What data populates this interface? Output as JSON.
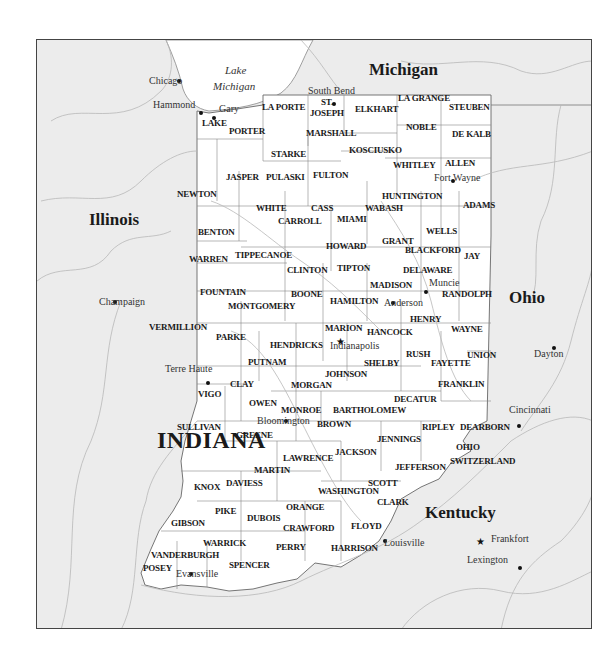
{
  "map": {
    "colors": {
      "background": "#ffffff",
      "neighbor_land": "#ececec",
      "indiana_fill": "#ffffff",
      "rivers": "#b8b8b8",
      "borders": "#777777",
      "frame": "#444444"
    },
    "lakes": [
      {
        "label_line1": "Lake",
        "label_line2": "Michigan",
        "x": 224,
        "y": 76
      }
    ],
    "states": [
      {
        "name": "Michigan",
        "x": 368,
        "y": 75,
        "main": false
      },
      {
        "name": "Illinois",
        "x": 88,
        "y": 225,
        "main": false
      },
      {
        "name": "Ohio",
        "x": 508,
        "y": 303,
        "main": false
      },
      {
        "name": "Kentucky",
        "x": 424,
        "y": 518,
        "main": false
      },
      {
        "name": "INDIANA",
        "x": 156,
        "y": 449,
        "main": true
      }
    ],
    "counties": [
      {
        "name": "LAKE",
        "x": 201,
        "y": 126
      },
      {
        "name": "PORTER",
        "x": 228,
        "y": 134
      },
      {
        "name": "LA PORTE",
        "x": 261,
        "y": 110
      },
      {
        "name": "ST.",
        "x": 320,
        "y": 105
      },
      {
        "name": "JOSEPH",
        "x": 309,
        "y": 116
      },
      {
        "name": "ELKHART",
        "x": 354,
        "y": 112
      },
      {
        "name": "LA GRANGE",
        "x": 397,
        "y": 101
      },
      {
        "name": "STEUBEN",
        "x": 448,
        "y": 110
      },
      {
        "name": "NOBLE",
        "x": 405,
        "y": 130
      },
      {
        "name": "DE KALB",
        "x": 451,
        "y": 137
      },
      {
        "name": "MARSHALL",
        "x": 305,
        "y": 136
      },
      {
        "name": "KOSCIUSKO",
        "x": 348,
        "y": 153
      },
      {
        "name": "STARKE",
        "x": 270,
        "y": 157
      },
      {
        "name": "WHITLEY",
        "x": 392,
        "y": 168
      },
      {
        "name": "ALLEN",
        "x": 444,
        "y": 166
      },
      {
        "name": "JASPER",
        "x": 225,
        "y": 180
      },
      {
        "name": "PULASKI",
        "x": 265,
        "y": 180
      },
      {
        "name": "FULTON",
        "x": 312,
        "y": 178
      },
      {
        "name": "NEWTON",
        "x": 176,
        "y": 197
      },
      {
        "name": "HUNTINGTON",
        "x": 381,
        "y": 199
      },
      {
        "name": "ADAMS",
        "x": 462,
        "y": 208
      },
      {
        "name": "WHITE",
        "x": 255,
        "y": 211
      },
      {
        "name": "CASS",
        "x": 310,
        "y": 211
      },
      {
        "name": "WABASH",
        "x": 364,
        "y": 211
      },
      {
        "name": "CARROLL",
        "x": 277,
        "y": 224
      },
      {
        "name": "MIAMI",
        "x": 336,
        "y": 222
      },
      {
        "name": "WELLS",
        "x": 425,
        "y": 234
      },
      {
        "name": "BENTON",
        "x": 197,
        "y": 235
      },
      {
        "name": "HOWARD",
        "x": 325,
        "y": 249
      },
      {
        "name": "GRANT",
        "x": 381,
        "y": 244
      },
      {
        "name": "BLACKFORD",
        "x": 404,
        "y": 253
      },
      {
        "name": "JAY",
        "x": 463,
        "y": 259
      },
      {
        "name": "WARREN",
        "x": 188,
        "y": 262
      },
      {
        "name": "TIPPECANOE",
        "x": 234,
        "y": 258
      },
      {
        "name": "CLINTON",
        "x": 286,
        "y": 273
      },
      {
        "name": "TIPTON",
        "x": 336,
        "y": 271
      },
      {
        "name": "DELAWARE",
        "x": 402,
        "y": 273
      },
      {
        "name": "MADISON",
        "x": 369,
        "y": 288
      },
      {
        "name": "RANDOLPH",
        "x": 441,
        "y": 297
      },
      {
        "name": "FOUNTAIN",
        "x": 199,
        "y": 295
      },
      {
        "name": "BOONE",
        "x": 290,
        "y": 297
      },
      {
        "name": "HAMILTON",
        "x": 329,
        "y": 304
      },
      {
        "name": "MONTGOMERY",
        "x": 227,
        "y": 309
      },
      {
        "name": "HENRY",
        "x": 409,
        "y": 322
      },
      {
        "name": "VERMILLION",
        "x": 148,
        "y": 330
      },
      {
        "name": "MARION",
        "x": 324,
        "y": 331
      },
      {
        "name": "HANCOCK",
        "x": 366,
        "y": 335
      },
      {
        "name": "WAYNE",
        "x": 450,
        "y": 332
      },
      {
        "name": "PARKE",
        "x": 215,
        "y": 340
      },
      {
        "name": "HENDRICKS",
        "x": 269,
        "y": 348
      },
      {
        "name": "RUSH",
        "x": 405,
        "y": 357
      },
      {
        "name": "UNION",
        "x": 466,
        "y": 358
      },
      {
        "name": "PUTNAM",
        "x": 247,
        "y": 365
      },
      {
        "name": "SHELBY",
        "x": 363,
        "y": 366
      },
      {
        "name": "FAYETTE",
        "x": 430,
        "y": 366
      },
      {
        "name": "JOHNSON",
        "x": 324,
        "y": 377
      },
      {
        "name": "FRANKLIN",
        "x": 437,
        "y": 387
      },
      {
        "name": "CLAY",
        "x": 229,
        "y": 387
      },
      {
        "name": "MORGAN",
        "x": 290,
        "y": 388
      },
      {
        "name": "VIGO",
        "x": 197,
        "y": 397
      },
      {
        "name": "DECATUR",
        "x": 393,
        "y": 402
      },
      {
        "name": "OWEN",
        "x": 248,
        "y": 406
      },
      {
        "name": "MONROE",
        "x": 280,
        "y": 413
      },
      {
        "name": "BARTHOLOMEW",
        "x": 332,
        "y": 413
      },
      {
        "name": "SULLIVAN",
        "x": 176,
        "y": 430
      },
      {
        "name": "BROWN",
        "x": 316,
        "y": 427
      },
      {
        "name": "RIPLEY",
        "x": 421,
        "y": 430
      },
      {
        "name": "DEARBORN",
        "x": 459,
        "y": 430
      },
      {
        "name": "GREENE",
        "x": 235,
        "y": 438
      },
      {
        "name": "JENNINGS",
        "x": 376,
        "y": 442
      },
      {
        "name": "OHIO",
        "x": 455,
        "y": 450
      },
      {
        "name": "JACKSON",
        "x": 334,
        "y": 455
      },
      {
        "name": "LAWRENCE",
        "x": 282,
        "y": 461
      },
      {
        "name": "SWITZERLAND",
        "x": 449,
        "y": 464
      },
      {
        "name": "MARTIN",
        "x": 253,
        "y": 473
      },
      {
        "name": "JEFFERSON",
        "x": 394,
        "y": 470
      },
      {
        "name": "KNOX",
        "x": 193,
        "y": 490
      },
      {
        "name": "DAVIESS",
        "x": 225,
        "y": 486
      },
      {
        "name": "SCOTT",
        "x": 367,
        "y": 486
      },
      {
        "name": "WASHINGTON",
        "x": 317,
        "y": 494
      },
      {
        "name": "CLARK",
        "x": 376,
        "y": 505
      },
      {
        "name": "ORANGE",
        "x": 285,
        "y": 510
      },
      {
        "name": "PIKE",
        "x": 214,
        "y": 514
      },
      {
        "name": "DUBOIS",
        "x": 246,
        "y": 521
      },
      {
        "name": "GIBSON",
        "x": 170,
        "y": 526
      },
      {
        "name": "FLOYD",
        "x": 350,
        "y": 529
      },
      {
        "name": "CRAWFORD",
        "x": 282,
        "y": 531
      },
      {
        "name": "WARRICK",
        "x": 202,
        "y": 546
      },
      {
        "name": "PERRY",
        "x": 275,
        "y": 550
      },
      {
        "name": "HARRISON",
        "x": 330,
        "y": 551
      },
      {
        "name": "VANDERBURGH",
        "x": 150,
        "y": 558
      },
      {
        "name": "POSEY",
        "x": 142,
        "y": 571
      },
      {
        "name": "SPENCER",
        "x": 228,
        "y": 568
      }
    ],
    "cities": [
      {
        "name": "Chicago",
        "label_x": 148,
        "label_y": 84,
        "dot_x": 178,
        "dot_y": 80,
        "marker": "dot"
      },
      {
        "name": "Hammond",
        "label_x": 152,
        "label_y": 108,
        "dot_x": 200,
        "dot_y": 112,
        "marker": "dot"
      },
      {
        "name": "Gary",
        "label_x": 218,
        "label_y": 112,
        "dot_x": 213,
        "dot_y": 117,
        "marker": "dot"
      },
      {
        "name": "South Bend",
        "label_x": 307,
        "label_y": 94,
        "dot_x": 333,
        "dot_y": 103,
        "marker": "dot"
      },
      {
        "name": "Fort Wayne",
        "label_x": 433,
        "label_y": 181,
        "dot_x": 452,
        "dot_y": 180,
        "marker": "dot"
      },
      {
        "name": "Muncie",
        "label_x": 428,
        "label_y": 286,
        "dot_x": 425,
        "dot_y": 291,
        "marker": "dot"
      },
      {
        "name": "Anderson",
        "label_x": 383,
        "label_y": 306,
        "dot_x": 392,
        "dot_y": 302,
        "marker": "dot"
      },
      {
        "name": "Indianapolis",
        "label_x": 329,
        "label_y": 349,
        "dot_x": 340,
        "dot_y": 341,
        "marker": "star"
      },
      {
        "name": "Champaign",
        "label_x": 98,
        "label_y": 305,
        "dot_x": 114,
        "dot_y": 301,
        "marker": "dot"
      },
      {
        "name": "Terre Haute",
        "label_x": 164,
        "label_y": 372,
        "dot_x": 207,
        "dot_y": 382,
        "marker": "dot"
      },
      {
        "name": "Bloomington",
        "label_x": 256,
        "label_y": 424,
        "dot_x": 285,
        "dot_y": 420,
        "marker": "dot"
      },
      {
        "name": "Dayton",
        "label_x": 533,
        "label_y": 357,
        "dot_x": 553,
        "dot_y": 347,
        "marker": "dot"
      },
      {
        "name": "Cincinnati",
        "label_x": 508,
        "label_y": 413,
        "dot_x": 518,
        "dot_y": 425,
        "marker": "dot"
      },
      {
        "name": "Louisville",
        "label_x": 383,
        "label_y": 546,
        "dot_x": 384,
        "dot_y": 540,
        "marker": "dot"
      },
      {
        "name": "Frankfort",
        "label_x": 490,
        "label_y": 542,
        "dot_x": 480,
        "dot_y": 541,
        "marker": "star"
      },
      {
        "name": "Lexington",
        "label_x": 466,
        "label_y": 563,
        "dot_x": 519,
        "dot_y": 567,
        "marker": "dot"
      },
      {
        "name": "Evansville",
        "label_x": 175,
        "label_y": 577,
        "dot_x": 190,
        "dot_y": 573,
        "marker": "dot"
      }
    ]
  }
}
